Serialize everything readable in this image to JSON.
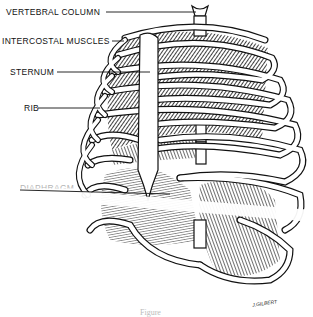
{
  "figure": {
    "labels": [
      {
        "id": "vertebral-column",
        "text": "VERTEBRAL COLUMN"
      },
      {
        "id": "intercostal-muscles",
        "text": "INTERCOSTAL MUSCLES"
      },
      {
        "id": "sternum",
        "text": "STERNUM"
      },
      {
        "id": "rib",
        "text": "RIB"
      },
      {
        "id": "diaphragm",
        "text": "DIAPHRAGM"
      }
    ],
    "signature": "J.GILBERT",
    "caption": "Figure"
  },
  "colors": {
    "ink": "#111111",
    "paper": "#ffffff"
  }
}
